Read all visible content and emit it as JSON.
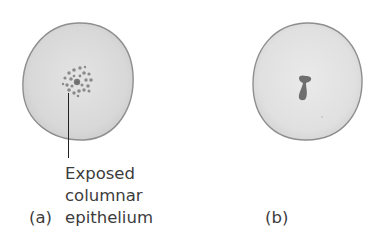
{
  "figure": {
    "panel_a": {
      "letter": "(a)",
      "annotation_lines": [
        "Exposed",
        "columnar",
        "epithelium"
      ],
      "description": "Cervix with exposed columnar epithelium around os"
    },
    "panel_b": {
      "letter": "(b)",
      "description": "Cervix with slit-like os"
    },
    "colors": {
      "cervix_fill": "#dcdcdc",
      "cervix_edge": "#8a8a8a",
      "spot_fill": "#8c8c8c",
      "os_fill": "#707070",
      "text": "#3c3c3c"
    }
  }
}
